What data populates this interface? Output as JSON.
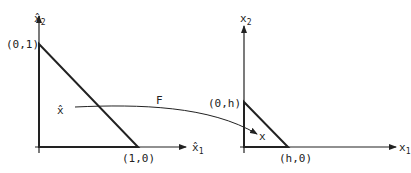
{
  "figure": {
    "left_panel": {
      "axis_y_label": "x̂",
      "axis_y_sub": "2",
      "axis_x_label": "x̂",
      "axis_x_sub": "1",
      "vertex_top": "(0,1)",
      "vertex_right": "(1,0)",
      "point_label": "x̂"
    },
    "mapping": {
      "label": "F"
    },
    "right_panel": {
      "axis_y_label": "x",
      "axis_y_sub": "2",
      "axis_x_label": "x",
      "axis_x_sub": "1",
      "vertex_top": "(0,h)",
      "vertex_right": "(h,0)",
      "point_label": "x"
    },
    "colors": {
      "line": "#222222",
      "background": "#ffffff"
    }
  }
}
